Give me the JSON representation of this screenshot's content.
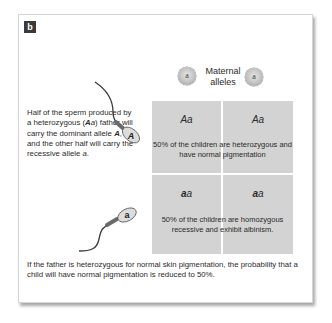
{
  "figure": {
    "panel_label": "b",
    "maternal": {
      "label_line1": "Maternal",
      "label_line2": "alleles",
      "alleles": [
        "a",
        "a"
      ]
    },
    "paternal": {
      "description_parts": {
        "p1": "Half of the sperm produced by a heterozygous (",
        "genotype_A": "A",
        "genotype_a": "a",
        "p2": ") father will carry the dominant allele ",
        "dominant": "A",
        "p3": ", and the other half will carry the recessive allele ",
        "recessive": "a",
        "p4": "."
      },
      "sperm_alleles": [
        "A",
        "a"
      ]
    },
    "punnett": {
      "cells": [
        {
          "first": "A",
          "second": "a"
        },
        {
          "first": "A",
          "second": "a"
        },
        {
          "first": "a",
          "second": "a"
        },
        {
          "first": "a",
          "second": "a"
        }
      ],
      "row_descriptions": [
        "50% of the children are heterozygous and have normal pigmentation",
        "50% of the children are homozygous recessive and exhibit albinism."
      ]
    },
    "conclusion": "If the father is heterozygous for normal skin pigmentation, the probability that a child will have normal pigmentation is reduced to 50%."
  },
  "colors": {
    "cell_fill": "#d3d3d3",
    "badge_fill": "#3a3a3a",
    "text": "#2b2b2b"
  }
}
